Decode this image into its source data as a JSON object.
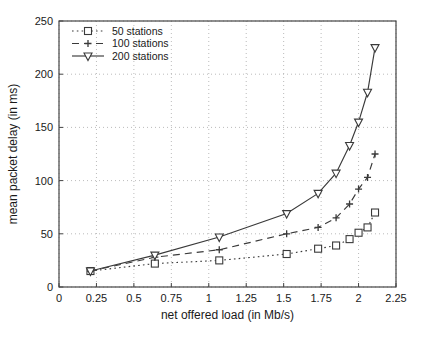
{
  "figure": {
    "kind": "scanned-journal-line-plot",
    "background": "#ffffff"
  },
  "chart_data": {
    "type": "line",
    "title": "",
    "xlabel": "net offered load (in Mb/s)",
    "ylabel": "mean packet delay (in ms)",
    "xlim": [
      0,
      2.25
    ],
    "ylim": [
      0,
      250
    ],
    "xticks": [
      0,
      0.25,
      0.5,
      0.75,
      1,
      1.25,
      1.5,
      1.75,
      2,
      2.25
    ],
    "yticks": [
      0,
      50,
      100,
      150,
      200,
      250
    ],
    "grid": true,
    "legend_position": "top-left",
    "x": [
      0.21,
      0.64,
      1.07,
      1.52,
      1.73,
      1.85,
      1.94,
      2.0,
      2.06,
      2.11
    ],
    "series": [
      {
        "name": "50 stations",
        "line_style": "dotted",
        "marker": "square",
        "values": [
          15,
          22,
          25,
          31,
          36,
          39,
          45,
          51,
          56,
          70
        ]
      },
      {
        "name": "100 stations",
        "line_style": "dashed",
        "marker": "plus",
        "values": [
          15,
          28,
          35,
          50,
          56,
          65,
          78,
          92,
          103,
          125
        ]
      },
      {
        "name": "200 stations",
        "line_style": "solid",
        "marker": "triangle-down",
        "values": [
          15,
          30,
          47,
          69,
          88,
          107,
          133,
          155,
          183,
          225
        ]
      }
    ],
    "colors": {
      "line": "#3a3a3a",
      "grid": "#aaaaaa",
      "axis": "#444444",
      "text": "#1a1a1a",
      "background": "#ffffff"
    }
  }
}
